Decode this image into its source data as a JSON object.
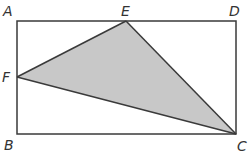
{
  "diagram": {
    "type": "geometry",
    "colors": {
      "stroke": "#3a3a3a",
      "shade": "#c8c8c8",
      "background": "#ffffff",
      "label": "#333333"
    },
    "rectangle": {
      "name": "ABCD",
      "vertices": [
        "A",
        "B",
        "C",
        "D"
      ]
    },
    "triangle": {
      "name": "EFC",
      "vertices": [
        "E",
        "F",
        "C"
      ],
      "shaded": true
    },
    "points": {
      "A": {
        "label": "A",
        "on": "top-left corner"
      },
      "B": {
        "label": "B",
        "on": "bottom-left corner"
      },
      "C": {
        "label": "C",
        "on": "bottom-right corner"
      },
      "D": {
        "label": "D",
        "on": "top-right corner"
      },
      "E": {
        "label": "E",
        "on": "side AD"
      },
      "F": {
        "label": "F",
        "on": "side AB"
      }
    }
  }
}
